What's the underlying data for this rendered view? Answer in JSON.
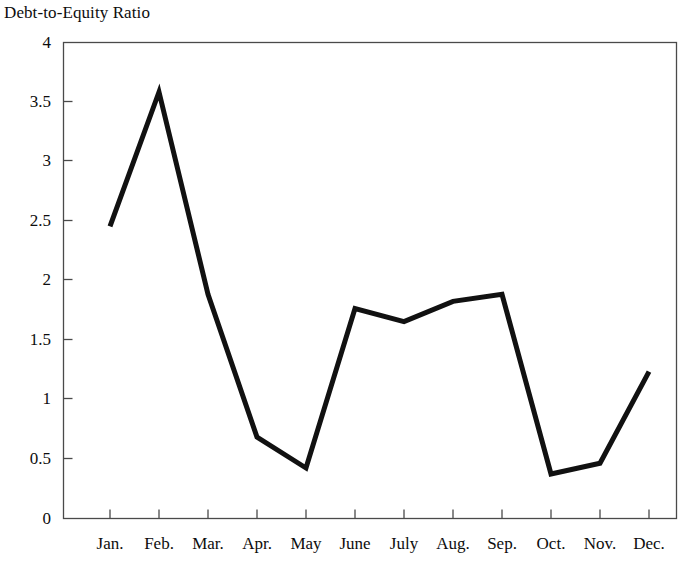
{
  "chart_data": {
    "type": "line",
    "title": "Debt-to-Equity Ratio",
    "xlabel": "",
    "ylabel": "",
    "categories": [
      "Jan.",
      "Feb.",
      "Mar.",
      "Apr.",
      "May",
      "June",
      "July",
      "Aug.",
      "Sep.",
      "Oct.",
      "Nov.",
      "Dec."
    ],
    "values": [
      2.45,
      3.58,
      1.88,
      0.68,
      0.42,
      1.76,
      1.65,
      1.82,
      1.88,
      0.37,
      0.46,
      1.23
    ],
    "series": [
      {
        "name": "Debt-to-Equity Ratio",
        "values": [
          2.45,
          3.58,
          1.88,
          0.68,
          0.42,
          1.76,
          1.65,
          1.82,
          1.88,
          0.37,
          0.46,
          1.23
        ]
      }
    ],
    "ylim": [
      0,
      4
    ],
    "ytick_labels": [
      "0",
      "0.5",
      "1",
      "1.5",
      "2",
      "2.5",
      "3",
      "3.5",
      "4"
    ],
    "ytick_values": [
      0,
      0.5,
      1,
      1.5,
      2,
      2.5,
      3,
      3.5,
      4
    ],
    "grid": false,
    "legend": "none",
    "line_color": "#111111",
    "frame_color": "#4a4a4a",
    "background_color": "#ffffff"
  },
  "axes": {
    "y_title": "",
    "x_title": ""
  }
}
